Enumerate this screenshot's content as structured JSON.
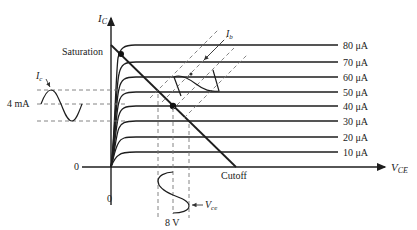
{
  "axes": {
    "y_label": "I",
    "y_label_sub": "C",
    "x_label": "V",
    "x_label_sub": "CE",
    "origin_x_tick": "0",
    "origin_y_tick": "0"
  },
  "annotations": {
    "saturation": "Saturation",
    "cutoff": "Cutoff",
    "ic_signal": "I",
    "ic_signal_sub": "c",
    "ic_value": "4 mA",
    "ib_signal": "I",
    "ib_signal_sub": "b",
    "vce_signal": "V",
    "vce_signal_sub": "ce",
    "vce_value": "8 V"
  },
  "curves": [
    {
      "label": "80 μA",
      "y": 45
    },
    {
      "label": "70 μA",
      "y": 62
    },
    {
      "label": "60 μA",
      "y": 77
    },
    {
      "label": "50 μA",
      "y": 92
    },
    {
      "label": "40 μA",
      "y": 106
    },
    {
      "label": "30 μA",
      "y": 121
    },
    {
      "label": "20 μA",
      "y": 137
    },
    {
      "label": "10 μA",
      "y": 152
    }
  ],
  "points": {
    "saturation_dot": {
      "x": 121,
      "y": 54
    },
    "q_point": {
      "x": 173,
      "y": 106
    }
  },
  "colors": {
    "line": "#1e1e1e",
    "dashed": "#777777",
    "background": "#ffffff"
  }
}
